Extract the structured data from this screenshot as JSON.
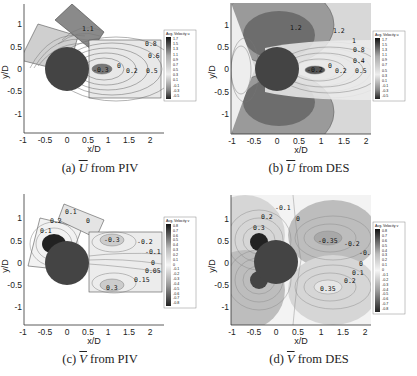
{
  "figure": {
    "panels": [
      {
        "id": "a",
        "caption_prefix": "(a)",
        "symbol": "U",
        "caption_suffix": "from PIV",
        "source": "PIV",
        "quantity": "U"
      },
      {
        "id": "b",
        "caption_prefix": "(b)",
        "symbol": "U",
        "caption_suffix": "from DES",
        "source": "DES",
        "quantity": "U"
      },
      {
        "id": "c",
        "caption_prefix": "(c)",
        "symbol": "V",
        "caption_suffix": "from PIV",
        "source": "PIV",
        "quantity": "V"
      },
      {
        "id": "d",
        "caption_prefix": "(d)",
        "symbol": "V",
        "caption_suffix": "from DES",
        "source": "DES",
        "quantity": "V"
      }
    ],
    "axes": {
      "xlabel": "x/D",
      "ylabel": "y/D",
      "xticks": [
        "-1",
        "-0.5",
        "0",
        "0.5",
        "1",
        "1.5",
        "2"
      ],
      "yticks": [
        "1",
        "0.5",
        "0",
        "-0.5",
        "-1"
      ]
    },
    "legend_u": {
      "title": "Avg. Velocity u",
      "values": [
        "1.7",
        "1.5",
        "1.3",
        "1.1",
        "0.9",
        "0.7",
        "0.5",
        "0.3",
        "0.1",
        "-0.1",
        "-0.3",
        "-0.5"
      ]
    },
    "legend_v": {
      "title": "Avg. Velocity v",
      "values": [
        "0.8",
        "0.7",
        "0.6",
        "0.5",
        "0.4",
        "0.3",
        "0.2",
        "0.1",
        "0",
        "-0.1",
        "-0.2",
        "-0.3",
        "-0.4",
        "-0.5",
        "-0.6",
        "-0.7",
        "-0.8"
      ]
    },
    "contour_labels": {
      "a": [
        "1.1",
        "0.8",
        "0.6",
        "-0.3",
        "0",
        "0.2",
        "0.5"
      ],
      "b": [
        "1.2",
        "1.2",
        "1",
        "0.8",
        "0.4",
        "-0.2",
        "0",
        "0.2",
        "0.5"
      ],
      "c": [
        "0.1",
        "0.2",
        "0.1",
        "0",
        "-0.3",
        "-0.2",
        "-0.1",
        "0",
        "0.05",
        "0.15",
        "0.3"
      ],
      "d": [
        "-0.1",
        "0.2",
        "0.3",
        "0",
        "-0.35",
        "-0.2",
        "-0.1",
        "0",
        "0.1",
        "0.2",
        "0.35"
      ]
    }
  },
  "chart_data": [
    {
      "type": "heatmap",
      "title": "(a) U from PIV",
      "xlabel": "x/D",
      "ylabel": "y/D",
      "xlim": [
        -1,
        2.3
      ],
      "ylim": [
        -1.4,
        1.4
      ],
      "colorbar": {
        "label": "Avg. Velocity u",
        "range": [
          -0.5,
          1.7
        ]
      },
      "annotations": [
        "1.1",
        "0.8",
        "0.6",
        "-0.3",
        "0",
        "0.2",
        "0.5"
      ],
      "cylinder": {
        "center": [
          0,
          0
        ],
        "diameter": 1
      }
    },
    {
      "type": "heatmap",
      "title": "(b) U from DES",
      "xlabel": "x/D",
      "ylabel": "y/D",
      "xlim": [
        -1,
        2.3
      ],
      "ylim": [
        -1.4,
        1.4
      ],
      "colorbar": {
        "label": "Avg. Velocity u",
        "range": [
          -0.5,
          1.7
        ]
      },
      "annotations": [
        "1.2",
        "1",
        "0.8",
        "0.4",
        "-0.2",
        "0",
        "0.2",
        "0.5"
      ],
      "cylinder": {
        "center": [
          0,
          0
        ],
        "diameter": 1
      }
    },
    {
      "type": "heatmap",
      "title": "(c) V from PIV",
      "xlabel": "x/D",
      "ylabel": "y/D",
      "xlim": [
        -1,
        2.3
      ],
      "ylim": [
        -1.4,
        1.4
      ],
      "colorbar": {
        "label": "Avg. Velocity v",
        "range": [
          -0.8,
          0.8
        ]
      },
      "annotations": [
        "0.1",
        "0.2",
        "0",
        "-0.3",
        "-0.2",
        "-0.1",
        "0.05",
        "0.15",
        "0.3"
      ],
      "cylinder": {
        "center": [
          0,
          0
        ],
        "diameter": 1
      }
    },
    {
      "type": "heatmap",
      "title": "(d) V from DES",
      "xlabel": "x/D",
      "ylabel": "y/D",
      "xlim": [
        -1,
        2.3
      ],
      "ylim": [
        -1.4,
        1.4
      ],
      "colorbar": {
        "label": "Avg. Velocity v",
        "range": [
          -0.8,
          0.8
        ]
      },
      "annotations": [
        "-0.1",
        "0.2",
        "0.3",
        "0",
        "-0.35",
        "-0.2",
        "0.1",
        "0.35"
      ],
      "cylinder": {
        "center": [
          0,
          0
        ],
        "diameter": 1
      }
    }
  ]
}
